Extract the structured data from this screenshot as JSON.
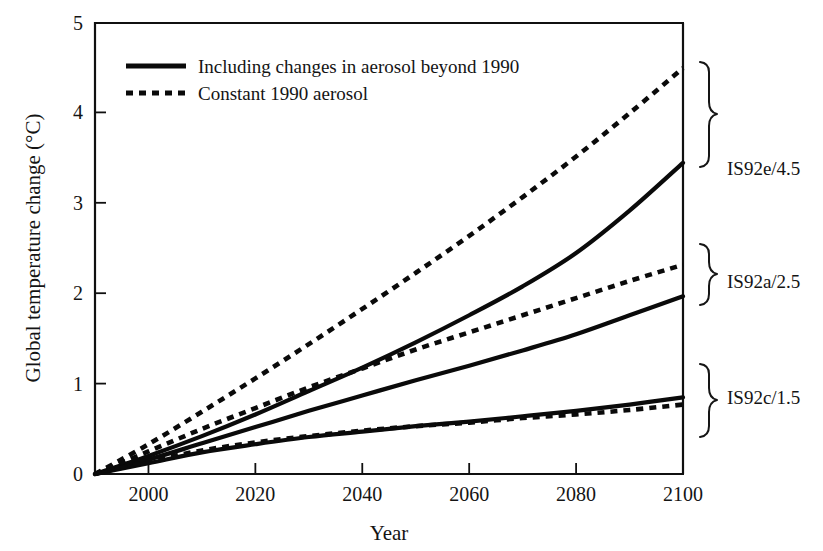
{
  "chart_data": {
    "type": "line",
    "title": "",
    "xlabel": "Year",
    "ylabel": "Global temperature change (°C)",
    "xlim": [
      1990,
      2100
    ],
    "ylim": [
      0,
      5
    ],
    "xticks": [
      2000,
      2020,
      2040,
      2060,
      2080,
      2100
    ],
    "yticks": [
      0,
      1,
      2,
      3,
      4,
      5
    ],
    "grid": false,
    "legend_position": "top-left",
    "legend": [
      {
        "key": "solid",
        "label": "Including changes in aerosol beyond 1990",
        "style": "solid"
      },
      {
        "key": "dashed",
        "label": "Constant 1990 aerosol",
        "style": "dashed"
      }
    ],
    "x": [
      1990,
      2000,
      2010,
      2020,
      2030,
      2040,
      2050,
      2060,
      2070,
      2080,
      2090,
      2100
    ],
    "series": [
      {
        "name": "IS92e/4.5 constant 1990 aerosol",
        "scenario": "IS92e/4.5",
        "style": "dashed",
        "values": [
          0.0,
          0.33,
          0.69,
          1.06,
          1.44,
          1.83,
          2.23,
          2.64,
          3.07,
          3.52,
          4.0,
          4.5
        ]
      },
      {
        "name": "IS92e/4.5 including aerosol changes",
        "scenario": "IS92e/4.5",
        "style": "solid",
        "values": [
          0.0,
          0.2,
          0.42,
          0.66,
          0.92,
          1.18,
          1.46,
          1.76,
          2.08,
          2.45,
          2.92,
          3.45
        ]
      },
      {
        "name": "IS92a/2.5 constant 1990 aerosol",
        "scenario": "IS92a/2.5",
        "style": "dashed",
        "values": [
          0.0,
          0.25,
          0.5,
          0.73,
          0.96,
          1.17,
          1.38,
          1.57,
          1.76,
          1.95,
          2.14,
          2.32
        ]
      },
      {
        "name": "IS92a/2.5 including aerosol changes",
        "scenario": "IS92a/2.5",
        "style": "solid",
        "values": [
          0.0,
          0.16,
          0.34,
          0.52,
          0.7,
          0.87,
          1.04,
          1.2,
          1.37,
          1.55,
          1.76,
          1.97
        ]
      },
      {
        "name": "IS92c/1.5 including aerosol changes",
        "scenario": "IS92c/1.5",
        "style": "solid",
        "values": [
          0.0,
          0.12,
          0.24,
          0.33,
          0.41,
          0.47,
          0.53,
          0.58,
          0.64,
          0.7,
          0.77,
          0.85
        ]
      },
      {
        "name": "IS92c/1.5 constant 1990 aerosol",
        "scenario": "IS92c/1.5",
        "style": "dashed",
        "values": [
          0.0,
          0.14,
          0.26,
          0.35,
          0.42,
          0.48,
          0.53,
          0.57,
          0.62,
          0.66,
          0.71,
          0.77
        ]
      }
    ],
    "annotations": [
      {
        "id": "brace-e",
        "label": "IS92e/4.5",
        "y_top": 4.5,
        "y_bottom": 3.45
      },
      {
        "id": "brace-a",
        "label": "IS92a/2.5",
        "y_top": 2.32,
        "y_bottom": 1.97
      },
      {
        "id": "brace-c",
        "label": "IS92c/1.5",
        "y_top": 1.1,
        "y_bottom": 0.5
      }
    ]
  },
  "axes": {
    "x_title": "Year",
    "y_title": "Global temperature change (°C)",
    "x_tick_labels": [
      "2000",
      "2020",
      "2040",
      "2060",
      "2080",
      "2100"
    ],
    "y_tick_labels": [
      "0",
      "1",
      "2",
      "3",
      "4",
      "5"
    ]
  },
  "legend": {
    "solid_label": "Including changes in aerosol beyond 1990",
    "dashed_label": "Constant 1990 aerosol"
  },
  "scenarios": {
    "high": "IS92e/4.5",
    "mid": "IS92a/2.5",
    "low": "IS92c/1.5"
  },
  "colors": {
    "ink": "#0a0a0a",
    "background": "#ffffff"
  }
}
